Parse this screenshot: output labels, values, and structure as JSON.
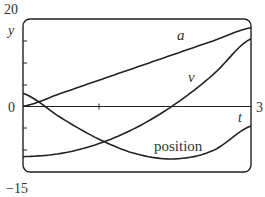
{
  "chart_data": {
    "type": "line",
    "title": "",
    "xlabel": "t",
    "ylabel": "y",
    "xlim": [
      0,
      3
    ],
    "ylim": [
      -15,
      20
    ],
    "x_ticks": [
      0,
      1,
      3
    ],
    "y_ticks": [
      -15,
      -10,
      -5,
      0,
      5,
      10,
      15,
      20
    ],
    "y_tick_labels_shown": [
      "20",
      "0",
      "-15"
    ],
    "x_tick_labels_shown": [
      "3"
    ],
    "grid": false,
    "legend": "inline labels",
    "series": [
      {
        "name": "a",
        "x": [
          0,
          0.5,
          1,
          1.5,
          2,
          2.5,
          3
        ],
        "values": [
          0,
          3,
          6,
          9,
          12,
          15,
          18
        ]
      },
      {
        "name": "v",
        "x": [
          0,
          0.5,
          1,
          1.5,
          2,
          2.5,
          3
        ],
        "values": [
          -11.5,
          -10.75,
          -8.5,
          -4.75,
          0.5,
          7.25,
          15.5
        ]
      },
      {
        "name": "position",
        "x": [
          0,
          0.5,
          1,
          1.5,
          2,
          2.5,
          3
        ],
        "values": [
          3,
          -2.6,
          -7.5,
          -10.9,
          -12,
          -10.1,
          -4.5
        ]
      }
    ]
  },
  "labels": {
    "y_max": "20",
    "y_min": "−15",
    "y_zero": "0",
    "x_max": "3",
    "y_axis": "y",
    "x_axis": "t",
    "series_a": "a",
    "series_v": "v",
    "series_position": "position"
  }
}
